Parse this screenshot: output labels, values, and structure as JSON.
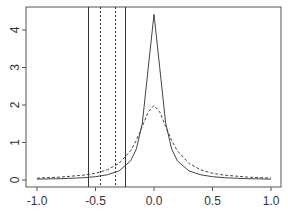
{
  "chart_data": {
    "type": "line",
    "title": "",
    "xlabel": "",
    "ylabel": "",
    "xlim": [
      -1.0,
      1.0
    ],
    "ylim": [
      0,
      4.5
    ],
    "x_ticks": [
      "-1.0",
      "-0.5",
      "0.0",
      "0.5",
      "1.0"
    ],
    "y_ticks": [
      "0",
      "1",
      "2",
      "3",
      "4"
    ],
    "grid": false,
    "legend": null,
    "x": [
      -1.0,
      -0.8,
      -0.6,
      -0.5,
      -0.4,
      -0.3,
      -0.2,
      -0.15,
      -0.1,
      -0.05,
      0.0,
      0.05,
      0.1,
      0.15,
      0.2,
      0.3,
      0.4,
      0.5,
      0.6,
      0.8,
      1.0
    ],
    "series": [
      {
        "name": "solid",
        "style": "solid",
        "values": [
          0.023,
          0.035,
          0.062,
          0.089,
          0.138,
          0.24,
          0.51,
          0.83,
          1.51,
          2.98,
          4.42,
          2.98,
          1.51,
          0.83,
          0.51,
          0.24,
          0.138,
          0.089,
          0.062,
          0.035,
          0.023
        ]
      },
      {
        "name": "dashed",
        "style": "dashed",
        "values": [
          0.05,
          0.077,
          0.13,
          0.18,
          0.27,
          0.44,
          0.78,
          1.06,
          1.43,
          1.81,
          1.99,
          1.81,
          1.43,
          1.06,
          0.78,
          0.44,
          0.27,
          0.18,
          0.13,
          0.077,
          0.05
        ]
      }
    ],
    "vertical_lines": [
      {
        "x": -0.56,
        "style": "solid"
      },
      {
        "x": -0.46,
        "style": "dotted"
      },
      {
        "x": -0.33,
        "style": "dotted"
      },
      {
        "x": -0.25,
        "style": "solid"
      }
    ]
  }
}
